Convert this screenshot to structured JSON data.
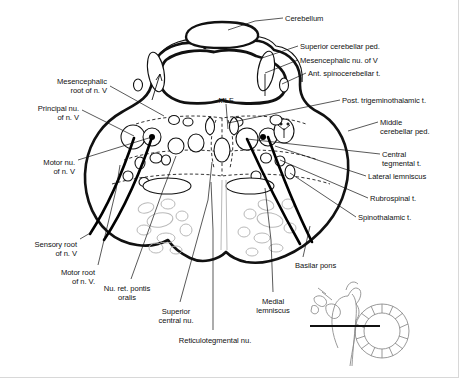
{
  "figure": {
    "domain": "Diagram",
    "title_text": "Axial section of the pons at the level of the trigeminal nerve roots",
    "background_color": "#ffffff",
    "ink_color": "#111111",
    "fiber_color": "#000000",
    "faint_color": "#b9b9b9",
    "inset_color": "#888888",
    "width": 459,
    "height": 378
  },
  "labels": [
    {
      "id": "cerebellum",
      "text": "Cerebellum",
      "align": "left",
      "x": 285,
      "y": 14
    },
    {
      "id": "superior-cerebellar-ped",
      "text": "Superior cerebellar ped.",
      "align": "left",
      "x": 300,
      "y": 42
    },
    {
      "id": "mesencephalic-nu-of-v",
      "text": "Mesencephalic nu. of V",
      "align": "left",
      "x": 300,
      "y": 56
    },
    {
      "id": "ant-spinocerebellar-t",
      "text": "Ant. spinocerebellar t.",
      "align": "left",
      "x": 308,
      "y": 69
    },
    {
      "id": "post-trigeminothalamic-t",
      "text": "Post. trigeminothalamic t.",
      "align": "left",
      "x": 342,
      "y": 96
    },
    {
      "id": "middle-cerebellar-ped",
      "text": "Middle\ncerebellar ped.",
      "align": "left",
      "x": 380,
      "y": 118
    },
    {
      "id": "central-tegmental-t",
      "text": "Central\ntegmental t.",
      "align": "left",
      "x": 382,
      "y": 150
    },
    {
      "id": "lateral-lemniscus",
      "text": "Lateral lemniscus",
      "align": "left",
      "x": 368,
      "y": 172
    },
    {
      "id": "rubrospinal-t",
      "text": "Rubrospinal t.",
      "align": "left",
      "x": 370,
      "y": 194
    },
    {
      "id": "spinothalamic-t",
      "text": "Spinothalamic t.",
      "align": "left",
      "x": 358,
      "y": 213
    },
    {
      "id": "basilar-pons",
      "text": "Basilar pons",
      "align": "left",
      "x": 295,
      "y": 261
    },
    {
      "id": "mlf",
      "text": "MLF",
      "align": "center",
      "x": 226,
      "y": 96
    },
    {
      "id": "mesencephalic-root-of-n-v",
      "text": "Mesencephalic\nroot of n. V",
      "align": "right",
      "x": 108,
      "y": 77
    },
    {
      "id": "principal-nu-of-n-v",
      "text": "Principal nu.\nof n. V",
      "align": "right",
      "x": 80,
      "y": 104
    },
    {
      "id": "motor-nu-of-n-v",
      "text": "Motor nu.\nof n. V",
      "align": "right",
      "x": 76,
      "y": 158
    },
    {
      "id": "sensory-root-of-n-v",
      "text": "Sensory root\nof n. V",
      "align": "right",
      "x": 78,
      "y": 240
    },
    {
      "id": "motor-root-of-n-v",
      "text": "Motor root\nof n. V.",
      "align": "right",
      "x": 96,
      "y": 268
    },
    {
      "id": "nu-ret-pontis-oralis",
      "text": "Nu. ret. pontis\noralis",
      "align": "center",
      "x": 127,
      "y": 284
    },
    {
      "id": "superior-central-nu",
      "text": "Superior\ncentral nu.",
      "align": "center",
      "x": 176,
      "y": 307
    },
    {
      "id": "reticulotegmental-nu",
      "text": "Reticulotegmental nu.",
      "align": "center",
      "x": 215,
      "y": 336
    },
    {
      "id": "medial-lemniscus",
      "text": "Medial\nlemniscus",
      "align": "center",
      "x": 273,
      "y": 297
    }
  ],
  "leaders": [
    {
      "id": "leader-cerebellum",
      "d": "M 283 18 L 255 21 L 228 30"
    },
    {
      "id": "leader-superior-cerebellar-ped",
      "d": "M 298 46 L 262 58"
    },
    {
      "id": "leader-mesencephalic-nu-of-v",
      "d": "M 298 60 L 265 73"
    },
    {
      "id": "leader-ant-spinocerebellar-t",
      "d": "M 306 73 L 282 84"
    },
    {
      "id": "leader-post-trigeminothalamic-t",
      "d": "M 340 100 L 228 123"
    },
    {
      "id": "leader-middle-cerebellar-ped",
      "d": "M 378 122 L 348 131"
    },
    {
      "id": "leader-central-tegmental-t",
      "d": "M 380 154 L 247 139"
    },
    {
      "id": "leader-lateral-lemniscus",
      "d": "M 366 176 L 275 146"
    },
    {
      "id": "leader-rubrospinal-t",
      "d": "M 368 198 L 280 160"
    },
    {
      "id": "leader-spinothalamic-t",
      "d": "M 356 217 L 290 173"
    },
    {
      "id": "leader-basilar-pons",
      "d": "M 303 257 L 310 226"
    },
    {
      "id": "leader-mlf",
      "d": "M 226 104 L 228 129"
    },
    {
      "id": "leader-mesencephalic-root-of-n-v",
      "d": "M 110 86 L 164 116"
    },
    {
      "id": "leader-principal-nu-of-n-v",
      "d": "M 82 110 L 134 136"
    },
    {
      "id": "leader-motor-nu-of-n-v",
      "d": "M 78 160 L 152 137"
    },
    {
      "id": "leader-sensory-root-of-n-v",
      "d": "M 80 239 L 92 232"
    },
    {
      "id": "leader-motor-root-of-n-v",
      "d": "M 98 265 L 116 190 L 120 165"
    },
    {
      "id": "leader-nu-ret-pontis-oralis",
      "d": "M 131 279 L 163 190 L 176 156"
    },
    {
      "id": "leader-superior-central-nu",
      "d": "M 180 302 L 208 200 L 212 162"
    },
    {
      "id": "leader-reticulotegmental-nu",
      "d": "M 213 330 L 213 230 L 211 182"
    },
    {
      "id": "leader-medial-lemniscus",
      "d": "M 273 292 L 271 240 L 265 188"
    }
  ],
  "inset": {
    "id": "orientation-inset",
    "description": "midsagittal brainstem and cerebellum with section-level line",
    "level_line": {
      "x1": 310,
      "y1": 326,
      "x2": 380,
      "y2": 326
    }
  }
}
